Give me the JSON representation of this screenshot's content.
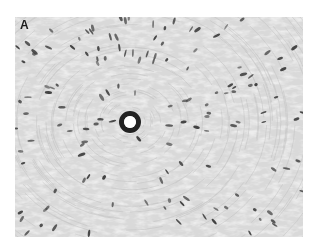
{
  "figure": {
    "panel_label": "A",
    "colors": {
      "background": "#dcdcdc",
      "fiber_light": "#f0f0f0",
      "fiber_dark": "#b8b8b8",
      "nucleus": "#3a3a3a",
      "vessel_wall": "#1e1e1e",
      "lumen": "#ffffff"
    },
    "vessel": {
      "cx": 115,
      "cy": 105,
      "outer_r": 11,
      "inner_r": 6
    }
  }
}
